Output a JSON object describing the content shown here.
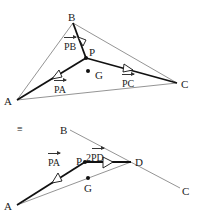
{
  "figure_top": {
    "points": {
      "A": {
        "label": "A",
        "x": 17,
        "y": 100
      },
      "B": {
        "label": "B",
        "x": 73,
        "y": 23
      },
      "C": {
        "label": "C",
        "x": 177,
        "y": 83
      },
      "P": {
        "label": "P",
        "x": 86,
        "y": 58
      },
      "G": {
        "label": "G",
        "x": 88,
        "y": 71
      }
    },
    "vectors": {
      "PA": "PA",
      "PB": "PB",
      "PC": "PC"
    }
  },
  "figure_bottom": {
    "equiv_symbol": "≡",
    "points": {
      "A": {
        "label": "A",
        "x": 17,
        "y": 205
      },
      "B": {
        "label": "B",
        "x": 70,
        "y": 130
      },
      "C": {
        "label": "C",
        "x": 180,
        "y": 188
      },
      "P": {
        "label": "P",
        "x": 85,
        "y": 162
      },
      "D": {
        "label": "D",
        "x": 131,
        "y": 162
      },
      "G": {
        "label": "G",
        "x": 88,
        "y": 178
      }
    },
    "vectors": {
      "PA": "PA",
      "PD_prefix": "2",
      "PD": "PD"
    }
  },
  "colors": {
    "thin_line": "#555555",
    "thick_line": "#111111",
    "text": "#222222"
  }
}
